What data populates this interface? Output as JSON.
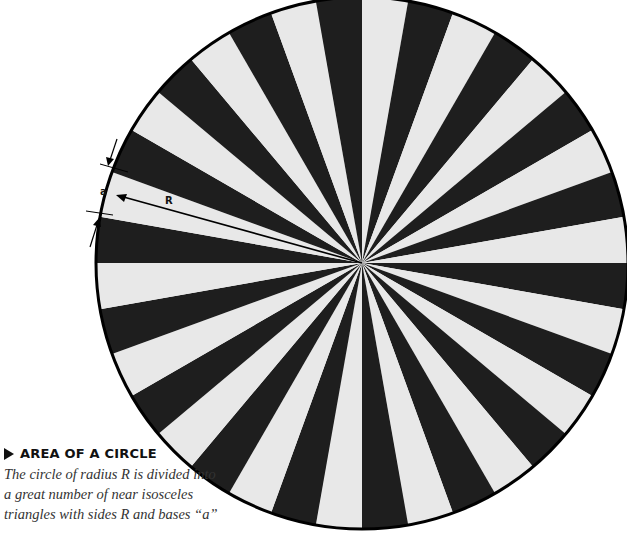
{
  "figure": {
    "sectors": 36,
    "center": [
      362,
      263
    ],
    "radius": 266,
    "colors": {
      "light": "#e8e8e8",
      "dark": "#1e1e1e",
      "outline": "#000000"
    },
    "labels": {
      "base": "a",
      "radius": "R"
    }
  },
  "caption": {
    "icon": "triangle-right-icon",
    "title": "AREA OF A CIRCLE",
    "lines": [
      "The circle of radius R is divided into",
      "a great number of near isosceles",
      "triangles with sides R and bases “a”"
    ]
  }
}
